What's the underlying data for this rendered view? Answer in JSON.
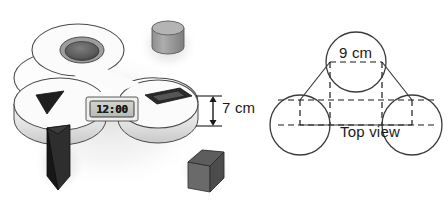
{
  "figure": {
    "left_illustration": {
      "name": "three-lobed-shape-sorter-body",
      "description": "White three-lobed shape sorter base shown in 3D",
      "clock": {
        "name": "digital-clock-display",
        "time_value": "12:00"
      },
      "sockets": [
        {
          "name": "circular-socket",
          "shape": "circle",
          "lobe": "top"
        },
        {
          "name": "triangular-socket",
          "shape": "triangle",
          "lobe": "left"
        },
        {
          "name": "rectangular-socket",
          "shape": "rectangle",
          "lobe": "right"
        }
      ],
      "loose_blocks": [
        {
          "name": "cylinder-block",
          "shape": "cylinder",
          "color": "#9a9a9a"
        },
        {
          "name": "triangular-prism-block",
          "shape": "triangular prism",
          "color": "#2b2b2b"
        },
        {
          "name": "cube-block",
          "shape": "cube",
          "color": "#5e5e5e"
        }
      ],
      "dimension": {
        "name": "height-dimension",
        "label": "7 cm",
        "value": 7,
        "unit": "cm"
      }
    },
    "right_diagram": {
      "name": "top-view-diagram",
      "caption": "Top view",
      "diameter_label": "9 cm",
      "diameter_value": 9,
      "unit": "cm",
      "circle_count": 3,
      "circles": [
        {
          "name": "top-circle",
          "cx": 356,
          "cy": 62,
          "r": 30
        },
        {
          "name": "bottom-left-circle",
          "cx": 300,
          "cy": 125,
          "r": 30
        },
        {
          "name": "bottom-right-circle",
          "cx": 412,
          "cy": 125,
          "r": 30
        }
      ],
      "solid_line_color": "#3b3b3b",
      "dashed_line_color": "#1a1a1a"
    },
    "colors": {
      "body_light": "#fdfdfd",
      "body_shade": "#d8d8d8",
      "body_outline": "#4a4a4a",
      "socket_dark": "#2e2e2e",
      "cylinder_gray": "#9b9b9b",
      "cube_gray": "#5f5f5f",
      "prism_dark": "#272727",
      "background": "#ffffff"
    }
  }
}
